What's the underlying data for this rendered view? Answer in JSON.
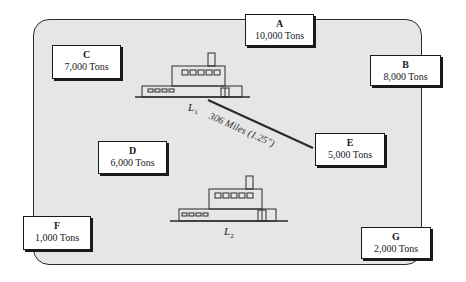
{
  "ports": [
    {
      "id": "A",
      "name": "A",
      "tonnage": "10,000 Tons"
    },
    {
      "id": "B",
      "name": "B",
      "tonnage": "8,000 Tons"
    },
    {
      "id": "C",
      "name": "C",
      "tonnage": "7,000 Tons"
    },
    {
      "id": "D",
      "name": "D",
      "tonnage": "6,000 Tons"
    },
    {
      "id": "E",
      "name": "E",
      "tonnage": "5,000 Tons"
    },
    {
      "id": "F",
      "name": "F",
      "tonnage": "1,000 Tons"
    },
    {
      "id": "G",
      "name": "G",
      "tonnage": "2,000 Tons"
    }
  ],
  "ships": [
    {
      "label": "L",
      "subscript": "1"
    },
    {
      "label": "L",
      "subscript": "2"
    }
  ],
  "distance": {
    "label": "306 Miles (1.25″)"
  },
  "colors": {
    "area_fill": "#e6e6e6",
    "border": "#1a1a1a"
  }
}
